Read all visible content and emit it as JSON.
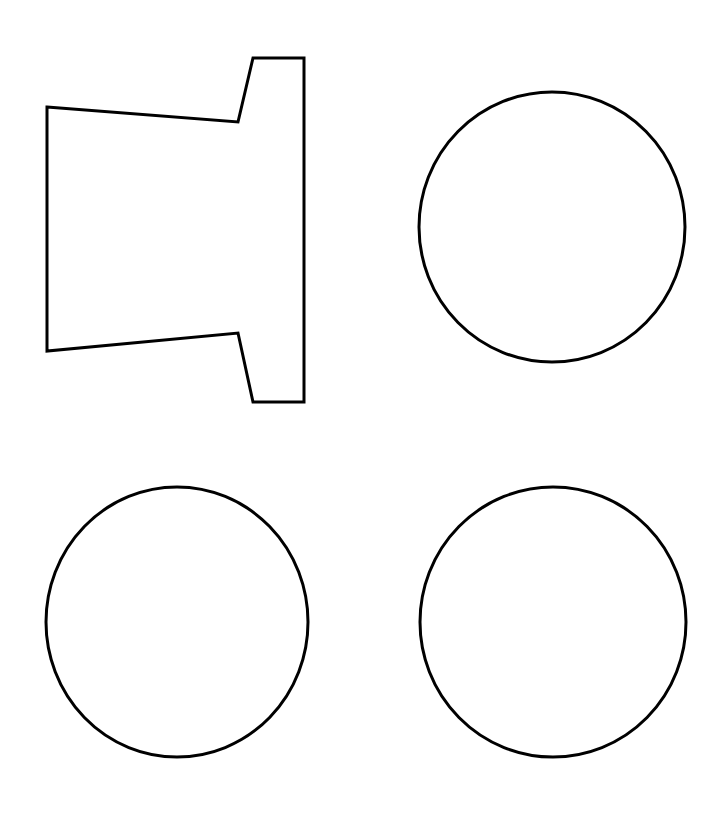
{
  "canvas": {
    "width": 716,
    "height": 832,
    "background": "#ffffff"
  },
  "style": {
    "stroke": "#000000",
    "stroke_width": 3,
    "fill": "none"
  },
  "shapes": [
    {
      "id": "flanged-trapezoid",
      "type": "polygon",
      "points": [
        [
          47,
          107
        ],
        [
          238,
          122
        ],
        [
          253,
          58
        ],
        [
          304,
          58
        ],
        [
          304,
          402
        ],
        [
          253,
          402
        ],
        [
          238,
          333
        ],
        [
          47,
          351
        ]
      ]
    },
    {
      "id": "circle-top-right",
      "type": "ellipse",
      "cx": 552,
      "cy": 227,
      "rx": 133,
      "ry": 135
    },
    {
      "id": "circle-bottom-left",
      "type": "ellipse",
      "cx": 177,
      "cy": 622,
      "rx": 131,
      "ry": 135
    },
    {
      "id": "circle-bottom-right",
      "type": "ellipse",
      "cx": 553,
      "cy": 622,
      "rx": 133,
      "ry": 135
    }
  ]
}
